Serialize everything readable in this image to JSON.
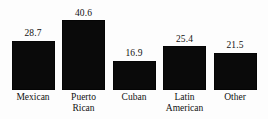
{
  "chart_data": {
    "type": "bar",
    "title": "",
    "subtitle": "",
    "xlabel": "",
    "ylabel": "",
    "ylim": [
      0,
      40.6
    ],
    "grid": false,
    "legend": false,
    "legend_position": "none",
    "bar_color": "#0a0a0a",
    "background_color": "#ffffff",
    "categories": [
      "Mexican",
      "Puerto Rican",
      "Cuban",
      "Latin American",
      "Other"
    ],
    "values": [
      28.7,
      40.6,
      16.9,
      25.4,
      21.5
    ],
    "data_labels": [
      "28.7",
      "40.6",
      "16.9",
      "25.4",
      "21.5"
    ],
    "bars": [
      {
        "category": "Mexican",
        "label_line1": "Mexican",
        "label_line2": "",
        "value": 28.7,
        "value_label": "28.7"
      },
      {
        "category": "Puerto Rican",
        "label_line1": "Puerto",
        "label_line2": "Rican",
        "value": 40.6,
        "value_label": "40.6"
      },
      {
        "category": "Cuban",
        "label_line1": "Cuban",
        "label_line2": "",
        "value": 16.9,
        "value_label": "16.9"
      },
      {
        "category": "Latin American",
        "label_line1": "Latin",
        "label_line2": "American",
        "value": 25.4,
        "value_label": "25.4"
      },
      {
        "category": "Other",
        "label_line1": "Other",
        "label_line2": "",
        "value": 21.5,
        "value_label": "21.5"
      }
    ]
  }
}
